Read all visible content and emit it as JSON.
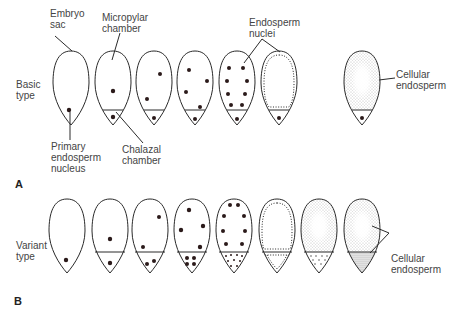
{
  "panels": {
    "A": {
      "panel_label": "A",
      "row_label": "Basic\ntype",
      "labels": {
        "embryo_sac": "Embryo\nsac",
        "micropylar_chamber": "Micropylar\nchamber",
        "endosperm_nuclei": "Endosperm\nnuclei",
        "cellular_endosperm": "Cellular\nendosperm",
        "primary_endosperm_nucleus": "Primary\nendosperm\nnucleus",
        "chalazal_chamber": "Chalazal\nchamber"
      },
      "stages": 7
    },
    "B": {
      "panel_label": "B",
      "row_label": "Variant\ntype",
      "labels": {
        "cellular_endosperm": "Cellular\nendosperm"
      },
      "stages": 8
    }
  },
  "colors": {
    "outline": "#2a2a2a",
    "nucleus": "#2b1a1a",
    "stipple": "#8a8a8a"
  }
}
